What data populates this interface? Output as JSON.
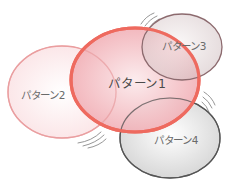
{
  "diagram": {
    "type": "overlapping-ellipses",
    "nodes": [
      {
        "id": "pattern1",
        "label": "パターン1",
        "cx": 135,
        "cy": 80,
        "rx": 64,
        "ry": 52,
        "stroke": "#ee6a5f",
        "stroke_width": 3.2,
        "fill_center": "#f8dadd",
        "fill_edge": "#f2b6bb",
        "label_x": 137,
        "label_y": 82,
        "emphasis": true
      },
      {
        "id": "pattern2",
        "label": "パターン2",
        "cx": 62,
        "cy": 92,
        "rx": 54,
        "ry": 46,
        "stroke": "#ec9c9c",
        "stroke_width": 1.4,
        "fill_center": "#ffffff",
        "fill_edge": "#fbe6e8",
        "label_x": 43,
        "label_y": 94,
        "emphasis": false
      },
      {
        "id": "pattern3",
        "label": "パターン3",
        "cx": 182,
        "cy": 47,
        "rx": 40,
        "ry": 33,
        "stroke": "#8c6a6e",
        "stroke_width": 1.3,
        "fill_center": "#f4eeee",
        "fill_edge": "#d8c9ca",
        "label_x": 184,
        "label_y": 45,
        "emphasis": false
      },
      {
        "id": "pattern4",
        "label": "パターン4",
        "cx": 170,
        "cy": 138,
        "rx": 50,
        "ry": 40,
        "stroke": "#505050",
        "stroke_width": 1.3,
        "fill_center": "#ffffff",
        "fill_edge": "#dcdcdc",
        "label_x": 176,
        "label_y": 139,
        "emphasis": false
      }
    ],
    "motion_marks": [
      {
        "near": "pattern3",
        "position": "top-left"
      },
      {
        "near": "pattern4",
        "position": "top-right"
      },
      {
        "near": "pattern1",
        "position": "bottom-left"
      }
    ]
  }
}
